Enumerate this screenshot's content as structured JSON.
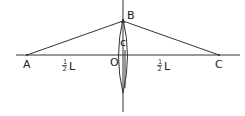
{
  "diagram": {
    "type": "optics-lens-ray-diagram",
    "colors": {
      "line": "#333333",
      "text": "#222222",
      "background": "#ffffff"
    },
    "points": {
      "A": {
        "label": "A",
        "x": 27,
        "y": 55
      },
      "B": {
        "label": "B",
        "x": 123,
        "y": 21
      },
      "C": {
        "label": "C",
        "x": 219,
        "y": 55
      },
      "O": {
        "label": "O",
        "x": 123,
        "y": 55
      }
    },
    "labels": {
      "A": "A",
      "B": "B",
      "C": "C",
      "O": "O",
      "lens_center": "c",
      "left_distance_num": "1",
      "left_distance_den": "2",
      "left_distance_var": "L",
      "right_distance_num": "1",
      "right_distance_den": "2",
      "right_distance_var": "L"
    },
    "segments": [
      {
        "name": "optical-axis",
        "from": [
          16,
          55
        ],
        "to": [
          240,
          55
        ]
      },
      {
        "name": "lens-axis",
        "from": [
          123,
          0
        ],
        "to": [
          123,
          112
        ]
      },
      {
        "name": "ray-AB",
        "from": [
          27,
          55
        ],
        "to": [
          123,
          21
        ]
      },
      {
        "name": "ray-BC",
        "from": [
          123,
          21
        ],
        "to": [
          219,
          55
        ]
      }
    ],
    "lens": {
      "cx": 123,
      "cy": 56,
      "rx": 6,
      "ry": 37
    }
  }
}
